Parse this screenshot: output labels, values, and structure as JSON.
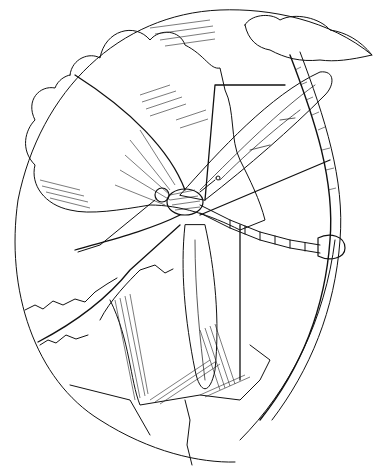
{
  "image": {
    "subject": "Crane fly illustration in oval frame",
    "style": "black ink line drawing on white",
    "colors": {
      "ink": "#111111",
      "background": "#ffffff"
    },
    "elements": [
      "oval-frame",
      "clouds",
      "crane-fly",
      "wings",
      "long-legs",
      "segmented-abdomen",
      "grass-stem",
      "rocky-ground"
    ]
  }
}
